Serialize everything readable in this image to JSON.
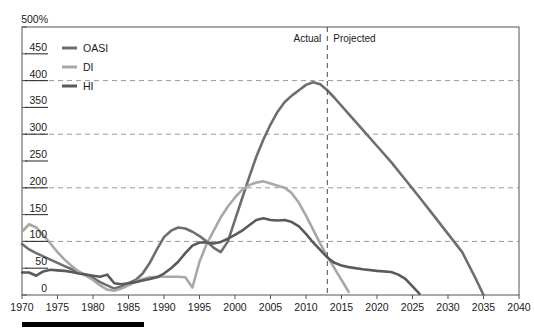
{
  "chart_data": {
    "type": "line",
    "title": "",
    "xlabel": "",
    "ylabel": "",
    "y_unit_label": "500%",
    "xlim": [
      1970,
      2040
    ],
    "ylim": [
      0,
      500
    ],
    "xticks": [
      1970,
      1975,
      1980,
      1985,
      1990,
      1995,
      2000,
      2005,
      2010,
      2015,
      2020,
      2025,
      2030,
      2035,
      2040
    ],
    "yticks": [
      0,
      50,
      100,
      150,
      200,
      250,
      300,
      350,
      400,
      450,
      500
    ],
    "ytick_labels": [
      "0",
      "50",
      "100",
      "150",
      "200",
      "250",
      "300",
      "350",
      "400",
      "450",
      "500%"
    ],
    "gridlines_y": [
      100,
      200,
      300,
      400
    ],
    "grid": "horizontal-dashed",
    "legend_position": "top-left-inside",
    "annotations": [
      {
        "name": "actual-label",
        "text": "Actual",
        "x": 2013,
        "align": "right"
      },
      {
        "name": "projected-label",
        "text": "Projected",
        "x": 2013,
        "align": "left"
      },
      {
        "name": "divider-line",
        "x": 2013,
        "style": "dashed-vertical"
      }
    ],
    "colors": {
      "OASI": "#6e6e6e",
      "DI": "#a8a8a8",
      "HI": "#5a5a5a",
      "grid": "#9a9a9a",
      "frame": "#555555",
      "text": "#1a1a1a",
      "bottom_bar": "#000000"
    },
    "series": [
      {
        "name": "OASI",
        "color": "#6e6e6e",
        "x": [
          1970,
          1971,
          1972,
          1973,
          1974,
          1975,
          1976,
          1977,
          1978,
          1979,
          1980,
          1981,
          1982,
          1983,
          1984,
          1985,
          1986,
          1987,
          1988,
          1989,
          1990,
          1991,
          1992,
          1993,
          1994,
          1995,
          1996,
          1997,
          1998,
          1999,
          2000,
          2001,
          2002,
          2003,
          2004,
          2005,
          2006,
          2007,
          2008,
          2009,
          2010,
          2011,
          2012,
          2013,
          2014,
          2016,
          2018,
          2020,
          2022,
          2024,
          2026,
          2028,
          2030,
          2032,
          2034,
          2035
        ],
        "values": [
          95,
          85,
          78,
          72,
          66,
          60,
          54,
          48,
          42,
          38,
          32,
          24,
          18,
          12,
          16,
          22,
          28,
          40,
          60,
          85,
          108,
          120,
          126,
          124,
          118,
          110,
          100,
          88,
          80,
          100,
          140,
          180,
          220,
          258,
          290,
          318,
          342,
          360,
          372,
          382,
          392,
          397,
          393,
          382,
          368,
          338,
          308,
          278,
          248,
          215,
          182,
          148,
          114,
          80,
          28,
          0
        ]
      },
      {
        "name": "DI",
        "color": "#a8a8a8",
        "x": [
          1970,
          1971,
          1972,
          1973,
          1974,
          1975,
          1976,
          1977,
          1978,
          1979,
          1980,
          1981,
          1982,
          1983,
          1984,
          1985,
          1986,
          1987,
          1988,
          1989,
          1990,
          1991,
          1992,
          1993,
          1994,
          1995,
          1996,
          1997,
          1998,
          1999,
          2000,
          2001,
          2002,
          2003,
          2004,
          2005,
          2006,
          2007,
          2008,
          2009,
          2010,
          2011,
          2012,
          2013,
          2014,
          2015,
          2016
        ],
        "values": [
          118,
          132,
          126,
          112,
          96,
          80,
          66,
          54,
          44,
          36,
          28,
          18,
          10,
          8,
          12,
          18,
          25,
          30,
          33,
          34,
          34,
          34,
          34,
          33,
          14,
          62,
          95,
          120,
          145,
          165,
          182,
          196,
          205,
          210,
          212,
          208,
          204,
          200,
          190,
          172,
          148,
          122,
          96,
          72,
          50,
          28,
          6
        ]
      },
      {
        "name": "HI",
        "color": "#5a5a5a",
        "x": [
          1970,
          1971,
          1972,
          1973,
          1974,
          1975,
          1976,
          1977,
          1978,
          1979,
          1980,
          1981,
          1982,
          1983,
          1984,
          1985,
          1986,
          1987,
          1988,
          1989,
          1990,
          1991,
          1992,
          1993,
          1994,
          1995,
          1996,
          1997,
          1998,
          1999,
          2000,
          2001,
          2002,
          2003,
          2004,
          2005,
          2006,
          2007,
          2008,
          2009,
          2010,
          2011,
          2012,
          2013,
          2014,
          2015,
          2016,
          2018,
          2020,
          2022,
          2023,
          2024,
          2025,
          2026
        ],
        "values": [
          42,
          42,
          36,
          44,
          47,
          46,
          45,
          43,
          40,
          38,
          36,
          34,
          38,
          22,
          20,
          22,
          24,
          27,
          30,
          33,
          40,
          50,
          62,
          78,
          92,
          98,
          98,
          96,
          99,
          105,
          112,
          120,
          130,
          140,
          143,
          140,
          139,
          140,
          136,
          128,
          114,
          98,
          84,
          70,
          60,
          55,
          52,
          48,
          45,
          43,
          38,
          30,
          16,
          2
        ]
      }
    ]
  },
  "legend": {
    "items": [
      {
        "label": "OASI",
        "color": "#6e6e6e"
      },
      {
        "label": "DI",
        "color": "#a8a8a8"
      },
      {
        "label": "HI",
        "color": "#5a5a5a"
      }
    ]
  },
  "axis": {
    "y_top_label": "500%",
    "y_labels": [
      "450",
      "400",
      "350",
      "300",
      "250",
      "200",
      "150",
      "100",
      "50",
      "0"
    ],
    "x_labels": [
      "1970",
      "1975",
      "1980",
      "1985",
      "1990",
      "1995",
      "2000",
      "2005",
      "2010",
      "2015",
      "2020",
      "2025",
      "2030",
      "2035",
      "2040"
    ]
  },
  "annotation": {
    "actual": "Actual",
    "projected": "Projected"
  }
}
